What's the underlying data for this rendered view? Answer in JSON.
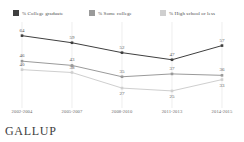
{
  "chart_data": {
    "type": "line",
    "title": "",
    "subtitle": "",
    "xlabel": "",
    "ylabel": "",
    "ylim": [
      20,
      68
    ],
    "grid": "vertical",
    "legend_position": "top",
    "categories": [
      "2002-2004",
      "2005-2007",
      "2008-2010",
      "2011-2013",
      "2014-2015"
    ],
    "series": [
      {
        "name": "% College graduate",
        "color": "#3f3f3f",
        "values": [
          64,
          59,
          52,
          47,
          57
        ],
        "labels": [
          "64",
          "59",
          "52",
          "47",
          "57"
        ]
      },
      {
        "name": "% Some college",
        "color": "#9a9a9a",
        "values": [
          46,
          43,
          35,
          37,
          36
        ],
        "labels": [
          "46",
          "43",
          "35",
          "37",
          "36"
        ]
      },
      {
        "name": "% High school or less",
        "color": "#cfcfcf",
        "values": [
          40,
          38,
          27,
          25,
          33
        ],
        "labels": [
          "40",
          "38",
          "27",
          "25",
          "33"
        ]
      }
    ]
  },
  "legend": {
    "items": [
      {
        "label": "% College graduate",
        "color": "#3f3f3f"
      },
      {
        "label": "% Some college",
        "color": "#9a9a9a"
      },
      {
        "label": "% High school or less",
        "color": "#cfcfcf"
      }
    ]
  },
  "footer": {
    "brand": "GALLUP"
  }
}
